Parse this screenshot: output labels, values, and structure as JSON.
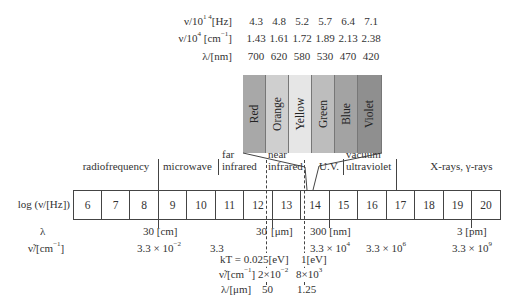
{
  "visible_table": {
    "rows": [
      {
        "label": "ν/10¹⁴[Hz]",
        "label_main": "ν/10",
        "label_sup": "1 4",
        "label_tail": "[Hz]",
        "values": [
          "4.3",
          "4.8",
          "5.2",
          "5.7",
          "6.4",
          "7.1"
        ]
      },
      {
        "label": "ν/10⁴ [cm⁻¹]",
        "label_main": "ν/10",
        "label_sup": "4",
        "label_mid": " [cm",
        "label_sup2": "−1",
        "label_tail": "]",
        "values": [
          "1.43",
          "1.61",
          "1.72",
          "1.89",
          "2.13",
          "2.38"
        ]
      },
      {
        "label": "λ/[nm]",
        "values": [
          "700",
          "620",
          "580",
          "530",
          "470",
          "420"
        ]
      }
    ]
  },
  "visible_bands": [
    {
      "name": "Red",
      "color": "#a8a8a8"
    },
    {
      "name": "Orange",
      "color": "#cfcfcf"
    },
    {
      "name": "Yellow",
      "color": "#e6e6e6"
    },
    {
      "name": "Green",
      "color": "#bdbdbd"
    },
    {
      "name": "Blue",
      "color": "#a3a3a3"
    },
    {
      "name": "Violet",
      "color": "#8f8f8f"
    }
  ],
  "regions": {
    "radiofrequency": "radiofrequency",
    "microwave": "microwave",
    "far_infrared_1": "far",
    "far_infrared_2": "infrared",
    "near_infrared_1": "near",
    "near_infrared_2": "infrared",
    "uv": "U.V.",
    "vacuum_uv_1": "vacuum",
    "vacuum_uv_2": "ultraviolet",
    "xray": "X-rays, γ-rays"
  },
  "scale": {
    "label": "log (ν/[Hz])",
    "ticks": [
      "6",
      "7",
      "8",
      "9",
      "10",
      "11",
      "12",
      "13",
      "14",
      "15",
      "16",
      "17",
      "18",
      "19",
      "20"
    ]
  },
  "wavelength_row": {
    "label": "λ",
    "marks": [
      "30 [cm]",
      "30",
      "[μm]",
      "300 [nm]",
      "3 [pm]"
    ]
  },
  "wavenumber_row": {
    "label": "ν̃/[cm⁻¹]",
    "label_main": "ν̃/[cm",
    "label_sup": "−1",
    "label_tail": "]",
    "values": [
      {
        "base": "3.3 × 10",
        "exp": "−2"
      },
      {
        "base": "3.3",
        "exp": ""
      },
      {
        "base": "3.3 × 10",
        "exp": "4"
      },
      {
        "base": "3.3 × 10",
        "exp": "6"
      },
      {
        "base": "3.3 × 10",
        "exp": "9"
      }
    ]
  },
  "energy_table": {
    "kt_label": "kT = 0.025[eV]",
    "ev_label": "1[eV]",
    "wn_label_main": "ν̃/[cm",
    "wn_label_sup": "−1",
    "wn_label_tail": "]",
    "wn_v1_base": "2×10",
    "wn_v1_exp": "−2",
    "wn_v2_base": "8×10",
    "wn_v2_exp": "3",
    "wl_label": "λ/[μm]",
    "wl_v1": "50",
    "wl_v2": "1.25"
  }
}
